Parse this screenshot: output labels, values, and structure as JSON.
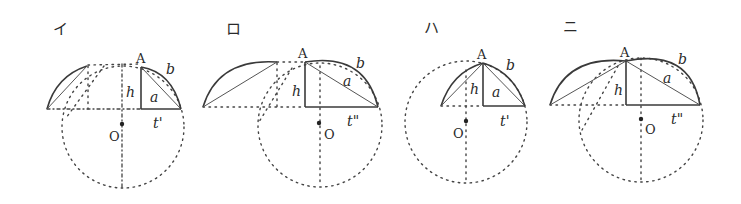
{
  "figure": {
    "panels": [
      {
        "id": "i",
        "panel_label": "イ",
        "labels": {
          "apex": "A",
          "arc": "b",
          "chord": "a",
          "height": "h",
          "center": "O",
          "base": "t'"
        }
      },
      {
        "id": "ro",
        "panel_label": "ロ",
        "labels": {
          "apex": "A",
          "arc": "b",
          "chord": "a",
          "height": "h",
          "center": "O",
          "base": "t\""
        }
      },
      {
        "id": "ha",
        "panel_label": "ハ",
        "labels": {
          "apex": "A",
          "arc": "b",
          "chord": "a",
          "height": "h",
          "center": "O",
          "base": "t'"
        }
      },
      {
        "id": "ni",
        "panel_label": "ニ",
        "labels": {
          "apex": "A",
          "arc": "b",
          "chord": "a",
          "height": "h",
          "center": "O",
          "base": "t\""
        }
      }
    ],
    "colors": {
      "ink": "#3a3a3a",
      "background": "#ffffff"
    }
  }
}
